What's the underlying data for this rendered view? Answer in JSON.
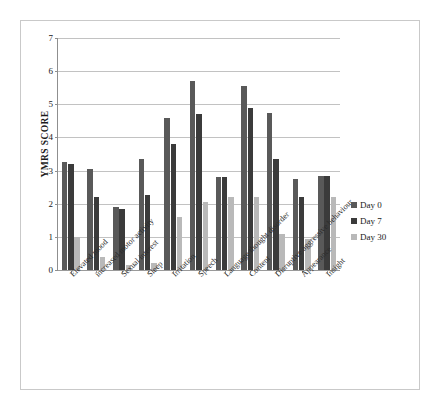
{
  "chart_data": {
    "type": "bar",
    "title": "",
    "xlabel": "",
    "ylabel": "YMRS SCORE",
    "ylim": [
      0,
      7
    ],
    "ytick_labels": [
      "7",
      "6",
      "5",
      "4",
      "3",
      "2",
      "1",
      "0"
    ],
    "ytick_values": [
      7,
      6,
      5,
      4,
      3,
      2,
      1,
      0
    ],
    "grid": true,
    "legend_position": "right",
    "categories": [
      "Elevated mood",
      "increased motor activity",
      "Sexual interest",
      "Sleep",
      "Irritation",
      "Speech",
      "Language thought disorder",
      "Content",
      "Disruptive aggressive behaviour",
      "Appearance",
      "Insight"
    ],
    "series": [
      {
        "name": "Day 0",
        "color": "#595959",
        "values": [
          3.25,
          3.05,
          1.9,
          3.35,
          4.6,
          5.7,
          2.8,
          5.55,
          4.75,
          2.75,
          2.85
        ]
      },
      {
        "name": "Day 7",
        "color": "#3b3b3b",
        "values": [
          3.2,
          2.2,
          1.85,
          2.25,
          3.8,
          4.7,
          2.8,
          4.9,
          3.35,
          2.2,
          2.85
        ]
      },
      {
        "name": "Day 30",
        "color": "#b9b9b9",
        "values": [
          1.0,
          0.4,
          0.15,
          0.2,
          1.6,
          2.05,
          2.2,
          2.2,
          1.1,
          0.95,
          2.2
        ]
      }
    ]
  },
  "legend": {
    "items": [
      {
        "label": "Day 0"
      },
      {
        "label": "Day 7"
      },
      {
        "label": "Day 30"
      }
    ]
  }
}
